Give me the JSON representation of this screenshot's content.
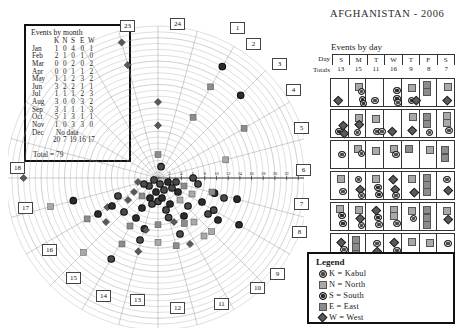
{
  "title": "AFGHANISTAN - 2006",
  "month_table": {
    "caption": "Events by month",
    "columns": [
      "K",
      "N",
      "S",
      "E",
      "W"
    ],
    "rows": [
      {
        "month": "Jan",
        "values": [
          "1",
          "0",
          "4",
          "0",
          "1"
        ]
      },
      {
        "month": "Feb",
        "values": [
          "2",
          "1",
          "0",
          "1",
          "0"
        ]
      },
      {
        "month": "Mar",
        "values": [
          "0",
          "0",
          "2",
          "0",
          "2"
        ]
      },
      {
        "month": "Apr",
        "values": [
          "0",
          "0",
          "1",
          "1",
          "2"
        ]
      },
      {
        "month": "May",
        "values": [
          "1",
          "1",
          "2",
          "3",
          "2"
        ]
      },
      {
        "month": "Jun",
        "values": [
          "3",
          "2",
          "2",
          "1",
          "1"
        ]
      },
      {
        "month": "Jul",
        "values": [
          "1",
          "1",
          "1",
          "2",
          "3"
        ]
      },
      {
        "month": "Aug",
        "values": [
          "3",
          "0",
          "0",
          "3",
          "2"
        ]
      },
      {
        "month": "Sep",
        "values": [
          "3",
          "1",
          "1",
          "1",
          "3"
        ]
      },
      {
        "month": "Oct",
        "values": [
          "5",
          "1",
          "3",
          "1",
          "1"
        ]
      },
      {
        "month": "Nov",
        "values": [
          "1",
          "0",
          "3",
          "3",
          "0"
        ]
      },
      {
        "month": "Dec",
        "no_data": "No data"
      }
    ],
    "totals": [
      "20",
      "7",
      "19",
      "16",
      "17"
    ],
    "grand_total": "Total = 79"
  },
  "day_panel": {
    "title": "Events by day",
    "row_label_day": "Day",
    "row_label_totals": "Totals",
    "days": [
      "S",
      "M",
      "T",
      "W",
      "T",
      "F",
      "S"
    ],
    "totals": [
      "13",
      "15",
      "11",
      "16",
      "9",
      "8",
      "7"
    ]
  },
  "legend": {
    "title": "Legend",
    "items": [
      {
        "key": "K",
        "label": "K = Kabul",
        "shape": "circle-ring",
        "color": "#4a4a4a"
      },
      {
        "key": "N",
        "label": "N = North",
        "shape": "square",
        "color": "#a9a9a9"
      },
      {
        "key": "S",
        "label": "S = South",
        "shape": "circle-ring",
        "color": "#2c2c2c"
      },
      {
        "key": "E",
        "label": "E = East",
        "shape": "square",
        "color": "#8c8c8c"
      },
      {
        "key": "W",
        "label": "W = West",
        "shape": "diamond",
        "color": "#5a5a5a"
      }
    ]
  },
  "polar": {
    "week_labels": [
      "1",
      "2",
      "3",
      "4",
      "5",
      "6",
      "7",
      "8",
      "9",
      "10",
      "11",
      "12",
      "13",
      "14",
      "15",
      "16",
      "17",
      "18",
      "23",
      "24"
    ],
    "radial_ticks": [
      "2",
      "4",
      "6",
      "8",
      "10",
      "12",
      "14",
      "16",
      "18",
      "20",
      "22",
      "24",
      "26"
    ]
  },
  "chart_data": [
    {
      "type": "scatter",
      "title": "Events by week (polar spiral)",
      "xlabel": "Week of year (angular)",
      "ylabel": "Event index (radial)",
      "rlim": [
        0,
        27
      ],
      "grid": true,
      "legend_position": "bottom-right",
      "categories": [
        "K = Kabul",
        "N = North",
        "S = South",
        "E = East",
        "W = West"
      ],
      "week_sectors": [
        "1",
        "2",
        "3",
        "4",
        "5",
        "6",
        "7",
        "8",
        "9",
        "10",
        "11",
        "12",
        "13",
        "14",
        "15",
        "16",
        "17",
        "18",
        "23",
        "24"
      ],
      "radial_ticks": [
        2,
        4,
        6,
        8,
        10,
        12,
        14,
        16,
        18,
        20,
        22,
        24,
        26
      ],
      "points": [
        {
          "week": 23,
          "r": 20,
          "region": "W"
        },
        {
          "week": 23,
          "r": 24,
          "region": "W"
        },
        {
          "week": 24,
          "r": 13,
          "region": "W"
        },
        {
          "week": 24,
          "r": 9,
          "region": "W"
        },
        {
          "week": 24,
          "r": 4,
          "region": "E"
        },
        {
          "week": 1,
          "r": 2,
          "region": "K"
        },
        {
          "week": 2,
          "r": 22,
          "region": "S"
        },
        {
          "week": 2,
          "r": 18,
          "region": "E"
        },
        {
          "week": 2,
          "r": 12,
          "region": "E"
        },
        {
          "week": 3,
          "r": 20,
          "region": "S"
        },
        {
          "week": 4,
          "r": 17,
          "region": "E"
        },
        {
          "week": 5,
          "r": 12,
          "region": "N"
        },
        {
          "week": 6,
          "r": 6,
          "region": "K"
        },
        {
          "week": 7,
          "r": 10,
          "region": "S"
        },
        {
          "week": 7,
          "r": 14,
          "region": "S"
        },
        {
          "week": 8,
          "r": 16,
          "region": "S"
        },
        {
          "week": 8,
          "r": 11,
          "region": "K"
        },
        {
          "week": 9,
          "r": 13,
          "region": "N"
        },
        {
          "week": 10,
          "r": 9,
          "region": "E"
        },
        {
          "week": 11,
          "r": 12,
          "region": "E"
        },
        {
          "week": 11,
          "r": 7,
          "region": "K"
        },
        {
          "week": 12,
          "r": 4,
          "region": "K"
        },
        {
          "week": 12,
          "r": 8,
          "region": "E"
        },
        {
          "week": 12,
          "r": 11,
          "region": "N"
        },
        {
          "week": 13,
          "r": 9,
          "region": "S"
        },
        {
          "week": 13,
          "r": 13,
          "region": "W"
        },
        {
          "week": 14,
          "r": 16,
          "region": "K"
        },
        {
          "week": 15,
          "r": 18,
          "region": "N"
        },
        {
          "week": 16,
          "r": 10,
          "region": "W"
        },
        {
          "week": 16,
          "r": 14,
          "region": "E"
        },
        {
          "week": 17,
          "r": 15,
          "region": "S"
        },
        {
          "week": 17,
          "r": 19,
          "region": "N"
        },
        {
          "week": 18,
          "r": 23,
          "region": "W"
        }
      ]
    },
    {
      "type": "bar",
      "title": "Events by day",
      "categories": [
        "S",
        "M",
        "T",
        "W",
        "T",
        "F",
        "S"
      ],
      "values": [
        13,
        15,
        11,
        16,
        9,
        8,
        7
      ],
      "xlabel": "Day",
      "ylabel": "Totals",
      "ylim": [
        0,
        16
      ]
    },
    {
      "type": "table",
      "title": "Events by month",
      "columns": [
        "Month",
        "K",
        "N",
        "S",
        "E",
        "W"
      ],
      "rows": [
        [
          "Jan",
          "1",
          "0",
          "4",
          "0",
          "1"
        ],
        [
          "Feb",
          "2",
          "1",
          "0",
          "1",
          "0"
        ],
        [
          "Mar",
          "0",
          "0",
          "2",
          "0",
          "2"
        ],
        [
          "Apr",
          "0",
          "0",
          "1",
          "1",
          "2"
        ],
        [
          "May",
          "1",
          "1",
          "2",
          "3",
          "2"
        ],
        [
          "Jun",
          "3",
          "2",
          "2",
          "1",
          "1"
        ],
        [
          "Jul",
          "1",
          "1",
          "1",
          "2",
          "3"
        ],
        [
          "Aug",
          "3",
          "0",
          "0",
          "3",
          "2"
        ],
        [
          "Sep",
          "3",
          "1",
          "1",
          "1",
          "3"
        ],
        [
          "Oct",
          "5",
          "1",
          "3",
          "1",
          "1"
        ],
        [
          "Nov",
          "1",
          "0",
          "3",
          "3",
          "0"
        ],
        [
          "Dec",
          "No data",
          "",
          "",
          "",
          ""
        ]
      ],
      "totals": [
        "",
        "20",
        "7",
        "19",
        "16",
        "17"
      ],
      "grand_total": 79
    }
  ]
}
